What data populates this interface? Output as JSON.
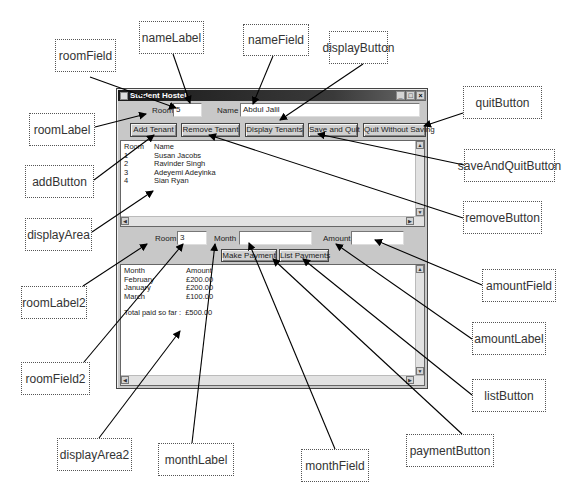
{
  "window": {
    "title": "Student Hostel",
    "controls": {
      "minimize": "_",
      "maximize": "□",
      "close": "×"
    }
  },
  "tenant_row": {
    "room_label": "Room",
    "room_value": "5",
    "name_label": "Name",
    "name_value": "Abdul Jalil"
  },
  "buttons": {
    "add": "Add Tenant",
    "remove": "Remove Tenant",
    "display": "Display Tenants",
    "save_quit": "Save and Quit",
    "quit": "Quit Without Saving"
  },
  "display_area": {
    "headers": [
      "Room",
      "Name"
    ],
    "rows": [
      [
        "1",
        "Susan Jacobs"
      ],
      [
        "2",
        "Ravinder Singh"
      ],
      [
        "3",
        "Adeyemi Adeyinka"
      ],
      [
        "4",
        "Sian Ryan"
      ]
    ]
  },
  "payment_row": {
    "room_label": "Room",
    "room_value": "3",
    "month_label": "Month",
    "month_value": "",
    "amount_label": "Amount",
    "amount_value": ""
  },
  "payment_buttons": {
    "make": "Make Payment",
    "list": "List Payments"
  },
  "display_area2": {
    "headers": [
      "Month",
      "Amount"
    ],
    "rows": [
      [
        "February",
        "£200.00"
      ],
      [
        "January",
        "£200.00"
      ],
      [
        "March",
        "£100.00"
      ]
    ],
    "total_label": "Total paid so far :",
    "total_value": "£500.00"
  },
  "callouts": {
    "roomField": "roomField",
    "nameLabel": "nameLabel",
    "nameField": "nameField",
    "displayButton": "displayButton",
    "roomLabel": "roomLabel",
    "addButton": "addButton",
    "displayArea": "displayArea",
    "quitButton": "quitButton",
    "saveAndQuitButton": "saveAndQuitButton",
    "removeButton": "removeButton",
    "amountField": "amountField",
    "amountLabel": "amountLabel",
    "listButton": "listButton",
    "paymentButton": "paymentButton",
    "monthField": "monthField",
    "monthLabel": "monthLabel",
    "displayArea2": "displayArea2",
    "roomField2": "roomField2",
    "roomLabel2": "roomLabel2"
  },
  "colors": {
    "titlebar": "#1a1a1a",
    "window_bg": "#c8c8c8",
    "callout_border": "#555555",
    "arrow": "#000000"
  }
}
